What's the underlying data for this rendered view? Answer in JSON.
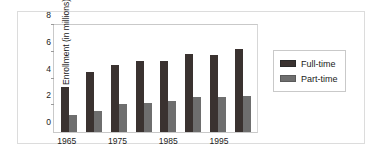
{
  "chart_data": {
    "type": "bar",
    "title": "",
    "xlabel": "",
    "ylabel": "Enrollment (in millions)",
    "ylim": [
      0,
      8
    ],
    "yticks": [
      0,
      2,
      4,
      6,
      8
    ],
    "ytick_labels": [
      "0",
      "2",
      "4",
      "6",
      "8"
    ],
    "grid": false,
    "legend_position": "right",
    "categories": [
      "1965",
      "1970",
      "1975",
      "1980",
      "1985",
      "1990",
      "1995",
      "2000"
    ],
    "visible_xtick_labels": [
      "1965",
      "1975",
      "1985",
      "1995"
    ],
    "series": [
      {
        "name": "Full-time",
        "color": "#3a3230",
        "values": [
          3.4,
          4.5,
          5.0,
          5.3,
          5.3,
          5.85,
          5.75,
          6.2
        ]
      },
      {
        "name": "Part-time",
        "color": "#6e6e6e",
        "values": [
          1.3,
          1.6,
          2.1,
          2.2,
          2.3,
          2.6,
          2.6,
          2.7
        ]
      }
    ]
  },
  "legend": {
    "items": [
      {
        "label": "Full-time"
      },
      {
        "label": "Part-time"
      }
    ]
  }
}
